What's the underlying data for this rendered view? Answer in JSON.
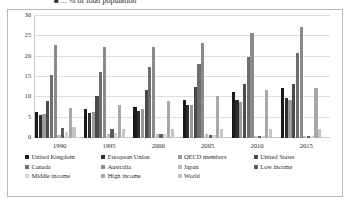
{
  "title": {
    "text": "■ ... % of total population",
    "clipped": true
  },
  "axis": {
    "yticks": [
      "30",
      "25",
      "20",
      "15",
      "10",
      "5",
      "0"
    ],
    "xlabels": [
      "1990",
      "1995",
      "2000",
      "2005",
      "2010",
      "2015"
    ]
  },
  "legend": {
    "rows": [
      [
        {
          "label": "United Kingdom",
          "color": "#1a1a1a"
        },
        {
          "label": "European Union",
          "color": "#2e2e2e"
        },
        {
          "label": "OECD members",
          "color": "#9a9a9a"
        },
        {
          "label": "United States",
          "color": "#4a4a4a"
        }
      ],
      [
        {
          "label": "Canada",
          "color": "#6e6e6e"
        },
        {
          "label": "Australia",
          "color": "#8a8a8a"
        },
        {
          "label": "Japan",
          "color": "#bdbdbd"
        },
        {
          "label": "Low income",
          "color": "#5e5e5e"
        }
      ],
      [
        {
          "label": "Middle income",
          "color": "#d2d2d2"
        },
        {
          "label": "High income",
          "color": "#a8a8a8"
        },
        {
          "label": "World",
          "color": "#c4c4c4"
        }
      ]
    ]
  },
  "chart_data": {
    "type": "bar",
    "title": "■ ... % of total population",
    "xlabel": "",
    "ylabel": "",
    "ylim": [
      0,
      30
    ],
    "ytick_step": 5,
    "grid": true,
    "legend_position": "bottom",
    "categories": [
      "1990",
      "1995",
      "2000",
      "2005",
      "2010",
      "2015"
    ],
    "series": [
      {
        "name": "United Kingdom",
        "color": "#1a1a1a",
        "values": [
          6.4,
          7.1,
          7.7,
          9.3,
          11.3,
          12.2
        ]
      },
      {
        "name": "European Union",
        "color": "#2e2e2e",
        "values": [
          5.6,
          6.1,
          6.7,
          8.2,
          9.4,
          9.9
        ]
      },
      {
        "name": "OECD members",
        "color": "#9a9a9a",
        "values": [
          5.8,
          6.4,
          7.1,
          8.0,
          8.8,
          9.4
        ]
      },
      {
        "name": "United States",
        "color": "#4a4a4a",
        "values": [
          9.2,
          10.4,
          11.8,
          12.6,
          13.4,
          13.4
        ]
      },
      {
        "name": "Canada",
        "color": "#6e6e6e",
        "values": [
          15.5,
          16.3,
          17.5,
          18.3,
          19.8,
          20.8
        ]
      },
      {
        "name": "Australia",
        "color": "#8a8a8a",
        "values": [
          22.9,
          22.5,
          22.4,
          23.4,
          25.8,
          27.2
        ]
      },
      {
        "name": "Japan",
        "color": "#bdbdbd",
        "values": [
          0.8,
          0.9,
          1.0,
          0.9,
          0.6,
          0.5
        ]
      },
      {
        "name": "Low income",
        "color": "#5e5e5e",
        "values": [
          2.4,
          2.1,
          1.1,
          0.8,
          0.5,
          0.5
        ]
      },
      {
        "name": "Middle income",
        "color": "#d2d2d2",
        "values": [
          1.5,
          1.2,
          1.0,
          0.8,
          0.6,
          0.6
        ]
      },
      {
        "name": "High income",
        "color": "#a8a8a8",
        "values": [
          7.5,
          8.1,
          9.2,
          10.3,
          11.8,
          12.4
        ]
      },
      {
        "name": "World",
        "color": "#c4c4c4",
        "values": [
          2.8,
          2.3,
          2.2,
          2.2,
          2.3,
          2.3
        ]
      }
    ]
  }
}
